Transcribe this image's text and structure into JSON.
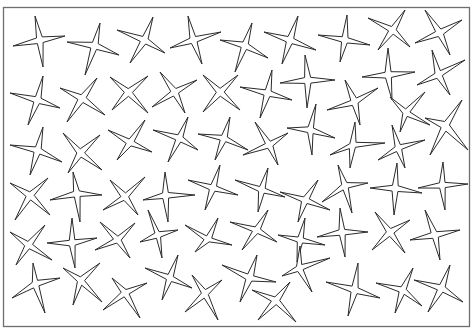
{
  "page": {
    "background": "#ffffff",
    "frame": {
      "x": 3.5,
      "y": 7.5,
      "width": 466,
      "height": 319,
      "stroke": "#6e6e6e"
    },
    "star_style": {
      "fill": "#ffffff",
      "stroke": "#2a2a2a",
      "inner_ratio": 0.22
    }
  },
  "stars": [
    {
      "c": [
        40,
        40
      ],
      "tips": [
        [
          35,
          16
        ],
        [
          65,
          36
        ],
        [
          43,
          67
        ],
        [
          13,
          46
        ]
      ]
    },
    {
      "c": [
        95,
        45
      ],
      "tips": [
        [
          100,
          23
        ],
        [
          119,
          55
        ],
        [
          85,
          75
        ],
        [
          67,
          42
        ]
      ]
    },
    {
      "c": [
        145,
        40
      ],
      "tips": [
        [
          153,
          17
        ],
        [
          165,
          53
        ],
        [
          130,
          63
        ],
        [
          117,
          30
        ]
      ]
    },
    {
      "c": [
        193,
        40
      ],
      "tips": [
        [
          188,
          16
        ],
        [
          221,
          32
        ],
        [
          202,
          64
        ],
        [
          170,
          48
        ]
      ]
    },
    {
      "c": [
        245,
        45
      ],
      "tips": [
        [
          252,
          23
        ],
        [
          268,
          58
        ],
        [
          235,
          72
        ],
        [
          220,
          40
        ]
      ]
    },
    {
      "c": [
        290,
        40
      ],
      "tips": [
        [
          298,
          16
        ],
        [
          316,
          50
        ],
        [
          282,
          64
        ],
        [
          264,
          32
        ]
      ]
    },
    {
      "c": [
        345,
        40
      ],
      "tips": [
        [
          347,
          15
        ],
        [
          370,
          45
        ],
        [
          340,
          62
        ],
        [
          318,
          35
        ]
      ]
    },
    {
      "c": [
        393,
        30
      ],
      "tips": [
        [
          405,
          10
        ],
        [
          410,
          47
        ],
        [
          378,
          50
        ],
        [
          368,
          18
        ]
      ]
    },
    {
      "c": [
        440,
        33
      ],
      "tips": [
        [
          425,
          10
        ],
        [
          462,
          20
        ],
        [
          450,
          55
        ],
        [
          415,
          43
        ]
      ]
    },
    {
      "c": [
        38,
        100
      ],
      "tips": [
        [
          43,
          76
        ],
        [
          60,
          108
        ],
        [
          28,
          125
        ],
        [
          10,
          93
        ]
      ]
    },
    {
      "c": [
        82,
        98
      ],
      "tips": [
        [
          97,
          78
        ],
        [
          105,
          115
        ],
        [
          67,
          122
        ],
        [
          60,
          88
        ]
      ]
    },
    {
      "c": [
        128,
        92
      ],
      "tips": [
        [
          148,
          76
        ],
        [
          148,
          113
        ],
        [
          112,
          110
        ],
        [
          110,
          77
        ]
      ]
    },
    {
      "c": [
        175,
        92
      ],
      "tips": [
        [
          160,
          72
        ],
        [
          197,
          80
        ],
        [
          185,
          113
        ],
        [
          152,
          107
        ]
      ]
    },
    {
      "c": [
        220,
        92
      ],
      "tips": [
        [
          203,
          75
        ],
        [
          238,
          75
        ],
        [
          240,
          110
        ],
        [
          203,
          112
        ]
      ]
    },
    {
      "c": [
        268,
        93
      ],
      "tips": [
        [
          272,
          70
        ],
        [
          292,
          100
        ],
        [
          260,
          118
        ],
        [
          240,
          87
        ]
      ]
    },
    {
      "c": [
        308,
        80
      ],
      "tips": [
        [
          305,
          55
        ],
        [
          335,
          80
        ],
        [
          307,
          108
        ],
        [
          280,
          83
        ]
      ]
    },
    {
      "c": [
        388,
        75
      ],
      "tips": [
        [
          388,
          48
        ],
        [
          415,
          72
        ],
        [
          392,
          100
        ],
        [
          362,
          77
        ]
      ]
    },
    {
      "c": [
        438,
        75
      ],
      "tips": [
        [
          432,
          50
        ],
        [
          465,
          60
        ],
        [
          450,
          95
        ],
        [
          417,
          85
        ]
      ]
    },
    {
      "c": [
        355,
        102
      ],
      "tips": [
        [
          378,
          88
        ],
        [
          360,
          125
        ],
        [
          327,
          110
        ],
        [
          345,
          80
        ]
      ]
    },
    {
      "c": [
        38,
        150
      ],
      "tips": [
        [
          43,
          127
        ],
        [
          62,
          162
        ],
        [
          30,
          175
        ],
        [
          10,
          145
        ]
      ]
    },
    {
      "c": [
        80,
        153
      ],
      "tips": [
        [
          100,
          135
        ],
        [
          102,
          170
        ],
        [
          68,
          173
        ],
        [
          63,
          133
        ]
      ]
    },
    {
      "c": [
        130,
        143
      ],
      "tips": [
        [
          145,
          120
        ],
        [
          152,
          152
        ],
        [
          117,
          160
        ],
        [
          108,
          130
        ]
      ]
    },
    {
      "c": [
        180,
        138
      ],
      "tips": [
        [
          188,
          117
        ],
        [
          198,
          150
        ],
        [
          168,
          162
        ],
        [
          153,
          130
        ]
      ]
    },
    {
      "c": [
        224,
        138
      ],
      "tips": [
        [
          230,
          117
        ],
        [
          248,
          150
        ],
        [
          215,
          160
        ],
        [
          198,
          134
        ]
      ]
    },
    {
      "c": [
        270,
        145
      ],
      "tips": [
        [
          255,
          122
        ],
        [
          288,
          133
        ],
        [
          278,
          165
        ],
        [
          243,
          155
        ]
      ]
    },
    {
      "c": [
        310,
        130
      ],
      "tips": [
        [
          316,
          104
        ],
        [
          335,
          138
        ],
        [
          312,
          155
        ],
        [
          287,
          128
        ]
      ]
    },
    {
      "c": [
        405,
        113
      ],
      "tips": [
        [
          425,
          92
        ],
        [
          430,
          125
        ],
        [
          400,
          132
        ],
        [
          390,
          97
        ]
      ]
    },
    {
      "c": [
        445,
        125
      ],
      "tips": [
        [
          462,
          100
        ],
        [
          468,
          150
        ],
        [
          430,
          155
        ],
        [
          425,
          118
        ]
      ]
    },
    {
      "c": [
        352,
        145
      ],
      "tips": [
        [
          355,
          122
        ],
        [
          385,
          143
        ],
        [
          350,
          168
        ],
        [
          330,
          155
        ]
      ]
    },
    {
      "c": [
        398,
        148
      ],
      "tips": [
        [
          392,
          125
        ],
        [
          425,
          140
        ],
        [
          405,
          168
        ],
        [
          378,
          160
        ]
      ]
    },
    {
      "c": [
        30,
        195
      ],
      "tips": [
        [
          48,
          178
        ],
        [
          50,
          215
        ],
        [
          15,
          220
        ],
        [
          10,
          183
        ]
      ]
    },
    {
      "c": [
        77,
        193
      ],
      "tips": [
        [
          73,
          172
        ],
        [
          102,
          195
        ],
        [
          80,
          222
        ],
        [
          50,
          200
        ]
      ]
    },
    {
      "c": [
        125,
        197
      ],
      "tips": [
        [
          145,
          177
        ],
        [
          138,
          215
        ],
        [
          103,
          210
        ],
        [
          110,
          180
        ]
      ]
    },
    {
      "c": [
        165,
        195
      ],
      "tips": [
        [
          165,
          172
        ],
        [
          195,
          195
        ],
        [
          168,
          222
        ],
        [
          143,
          200
        ]
      ]
    },
    {
      "c": [
        213,
        188
      ],
      "tips": [
        [
          220,
          165
        ],
        [
          238,
          195
        ],
        [
          205,
          210
        ],
        [
          188,
          180
        ]
      ]
    },
    {
      "c": [
        262,
        190
      ],
      "tips": [
        [
          268,
          168
        ],
        [
          285,
          197
        ],
        [
          258,
          212
        ],
        [
          235,
          180
        ]
      ]
    },
    {
      "c": [
        305,
        200
      ],
      "tips": [
        [
          318,
          180
        ],
        [
          330,
          210
        ],
        [
          298,
          222
        ],
        [
          280,
          192
        ]
      ]
    },
    {
      "c": [
        345,
        185
      ],
      "tips": [
        [
          338,
          165
        ],
        [
          368,
          183
        ],
        [
          352,
          213
        ],
        [
          322,
          202
        ]
      ]
    },
    {
      "c": [
        395,
        188
      ],
      "tips": [
        [
          397,
          163
        ],
        [
          422,
          193
        ],
        [
          394,
          215
        ],
        [
          370,
          188
        ]
      ]
    },
    {
      "c": [
        442,
        185
      ],
      "tips": [
        [
          443,
          162
        ],
        [
          468,
          184
        ],
        [
          445,
          210
        ],
        [
          418,
          188
        ]
      ]
    },
    {
      "c": [
        28,
        245
      ],
      "tips": [
        [
          45,
          225
        ],
        [
          52,
          260
        ],
        [
          16,
          265
        ],
        [
          10,
          232
        ]
      ]
    },
    {
      "c": [
        72,
        243
      ],
      "tips": [
        [
          72,
          218
        ],
        [
          97,
          238
        ],
        [
          75,
          268
        ],
        [
          47,
          243
        ]
      ]
    },
    {
      "c": [
        118,
        240
      ],
      "tips": [
        [
          135,
          223
        ],
        [
          130,
          258
        ],
        [
          95,
          250
        ],
        [
          100,
          222
        ]
      ]
    },
    {
      "c": [
        158,
        235
      ],
      "tips": [
        [
          148,
          210
        ],
        [
          178,
          230
        ],
        [
          162,
          258
        ],
        [
          140,
          242
        ]
      ]
    },
    {
      "c": [
        208,
        240
      ],
      "tips": [
        [
          218,
          218
        ],
        [
          232,
          245
        ],
        [
          195,
          252
        ],
        [
          185,
          225
        ]
      ]
    },
    {
      "c": [
        257,
        230
      ],
      "tips": [
        [
          268,
          210
        ],
        [
          277,
          242
        ],
        [
          242,
          250
        ],
        [
          230,
          222
        ]
      ]
    },
    {
      "c": [
        300,
        240
      ],
      "tips": [
        [
          305,
          218
        ],
        [
          325,
          245
        ],
        [
          297,
          262
        ],
        [
          278,
          235
        ]
      ]
    },
    {
      "c": [
        342,
        232
      ],
      "tips": [
        [
          340,
          208
        ],
        [
          368,
          232
        ],
        [
          345,
          257
        ],
        [
          317,
          237
        ]
      ]
    },
    {
      "c": [
        390,
        232
      ],
      "tips": [
        [
          410,
          220
        ],
        [
          405,
          253
        ],
        [
          372,
          250
        ],
        [
          375,
          212
        ]
      ]
    },
    {
      "c": [
        435,
        235
      ],
      "tips": [
        [
          425,
          210
        ],
        [
          460,
          230
        ],
        [
          440,
          260
        ],
        [
          410,
          240
        ]
      ]
    },
    {
      "c": [
        35,
        283
      ],
      "tips": [
        [
          33,
          263
        ],
        [
          60,
          278
        ],
        [
          45,
          313
        ],
        [
          12,
          298
        ]
      ]
    },
    {
      "c": [
        80,
        280
      ],
      "tips": [
        [
          100,
          263
        ],
        [
          102,
          302
        ],
        [
          73,
          305
        ],
        [
          63,
          268
        ]
      ]
    },
    {
      "c": [
        125,
        292
      ],
      "tips": [
        [
          112,
          278
        ],
        [
          147,
          283
        ],
        [
          140,
          318
        ],
        [
          103,
          310
        ]
      ]
    },
    {
      "c": [
        170,
        278
      ],
      "tips": [
        [
          178,
          255
        ],
        [
          192,
          288
        ],
        [
          162,
          300
        ],
        [
          145,
          268
        ]
      ]
    },
    {
      "c": [
        205,
        293
      ],
      "tips": [
        [
          222,
          280
        ],
        [
          218,
          320
        ],
        [
          185,
          312
        ],
        [
          192,
          275
        ]
      ]
    },
    {
      "c": [
        250,
        278
      ],
      "tips": [
        [
          257,
          255
        ],
        [
          276,
          282
        ],
        [
          240,
          302
        ],
        [
          222,
          265
        ]
      ]
    },
    {
      "c": [
        298,
        268
      ],
      "tips": [
        [
          300,
          246
        ],
        [
          330,
          258
        ],
        [
          312,
          292
        ],
        [
          282,
          276
        ]
      ]
    },
    {
      "c": [
        276,
        300
      ],
      "tips": [
        [
          290,
          282
        ],
        [
          296,
          322
        ],
        [
          258,
          320
        ],
        [
          252,
          290
        ]
      ]
    },
    {
      "c": [
        355,
        290
      ],
      "tips": [
        [
          358,
          263
        ],
        [
          380,
          298
        ],
        [
          348,
          316
        ],
        [
          326,
          282
        ]
      ]
    },
    {
      "c": [
        403,
        290
      ],
      "tips": [
        [
          413,
          268
        ],
        [
          422,
          306
        ],
        [
          395,
          313
        ],
        [
          376,
          283
        ]
      ]
    },
    {
      "c": [
        442,
        288
      ],
      "tips": [
        [
          450,
          265
        ],
        [
          463,
          302
        ],
        [
          428,
          312
        ],
        [
          414,
          280
        ]
      ]
    }
  ]
}
